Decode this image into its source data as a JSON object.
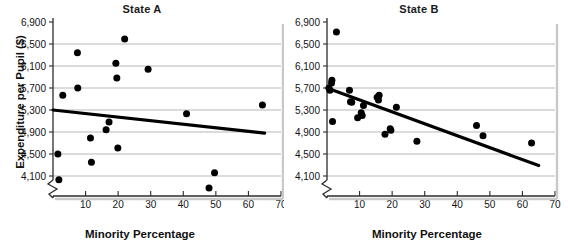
{
  "figure": {
    "axis_label_x": "Minority Percentage",
    "axis_label_y": "Expenditure per Pupil ($)"
  },
  "chart_data": [
    {
      "type": "scatter",
      "title": "State A",
      "xlabel": "Minority Percentage",
      "ylabel": "Expenditure per Pupil ($)",
      "xlim": [
        0,
        70
      ],
      "ylim": [
        3900,
        6900
      ],
      "xticks": [
        10,
        20,
        30,
        40,
        50,
        60,
        70
      ],
      "xtick_labels": [
        "10",
        "20",
        "30",
        "40",
        "50",
        "60",
        "70"
      ],
      "yticks": [
        4100,
        4500,
        4900,
        5300,
        5700,
        6100,
        6500,
        6900
      ],
      "ytick_labels": [
        "4,100",
        "4,500",
        "4,900",
        "5,300",
        "5,700",
        "6,100",
        "6,500",
        "6,900"
      ],
      "grid": true,
      "y_axis_break": true,
      "points": [
        {
          "x": 1.5,
          "y": 4500
        },
        {
          "x": 1.8,
          "y": 4030
        },
        {
          "x": 3.0,
          "y": 5570
        },
        {
          "x": 7.5,
          "y": 6340
        },
        {
          "x": 7.6,
          "y": 5700
        },
        {
          "x": 11.5,
          "y": 4790
        },
        {
          "x": 11.8,
          "y": 4350
        },
        {
          "x": 16.3,
          "y": 4940
        },
        {
          "x": 17.2,
          "y": 5080
        },
        {
          "x": 19.3,
          "y": 6150
        },
        {
          "x": 19.6,
          "y": 5880
        },
        {
          "x": 19.9,
          "y": 4610
        },
        {
          "x": 22.0,
          "y": 6590
        },
        {
          "x": 29.2,
          "y": 6040
        },
        {
          "x": 41.0,
          "y": 5230
        },
        {
          "x": 47.9,
          "y": 3880
        },
        {
          "x": 49.6,
          "y": 4160
        },
        {
          "x": 64.3,
          "y": 5390
        }
      ],
      "trendline": {
        "x0": 0,
        "y0": 5300,
        "x1": 65,
        "y1": 4880,
        "label": "regression-line"
      }
    },
    {
      "type": "scatter",
      "title": "State B",
      "xlabel": "Minority Percentage",
      "ylabel": "Expenditure per Pupil ($)",
      "xlim": [
        0,
        70
      ],
      "ylim": [
        3900,
        6900
      ],
      "xticks": [
        10,
        20,
        30,
        40,
        50,
        60,
        70
      ],
      "xtick_labels": [
        "10",
        "20",
        "30",
        "40",
        "50",
        "60",
        "70"
      ],
      "yticks": [
        4100,
        4500,
        4900,
        5300,
        5700,
        6100,
        6500,
        6900
      ],
      "ytick_labels": [
        "4,100",
        "4,500",
        "4,900",
        "5,300",
        "5,700",
        "6,100",
        "6,500",
        "6,900"
      ],
      "grid": true,
      "y_axis_break": true,
      "points": [
        {
          "x": 0.6,
          "y": 5700
        },
        {
          "x": 0.9,
          "y": 5660
        },
        {
          "x": 1.4,
          "y": 5790
        },
        {
          "x": 1.5,
          "y": 5840
        },
        {
          "x": 1.7,
          "y": 5090
        },
        {
          "x": 2.9,
          "y": 6720
        },
        {
          "x": 6.9,
          "y": 5660
        },
        {
          "x": 7.2,
          "y": 5450
        },
        {
          "x": 7.6,
          "y": 5440
        },
        {
          "x": 9.4,
          "y": 5160
        },
        {
          "x": 10.5,
          "y": 5250
        },
        {
          "x": 10.8,
          "y": 5200
        },
        {
          "x": 11.2,
          "y": 5380
        },
        {
          "x": 15.4,
          "y": 5530
        },
        {
          "x": 15.8,
          "y": 5480
        },
        {
          "x": 16.0,
          "y": 5570
        },
        {
          "x": 17.8,
          "y": 4860
        },
        {
          "x": 19.4,
          "y": 4960
        },
        {
          "x": 19.6,
          "y": 4930
        },
        {
          "x": 21.3,
          "y": 5350
        },
        {
          "x": 27.6,
          "y": 4730
        },
        {
          "x": 45.9,
          "y": 5020
        },
        {
          "x": 47.9,
          "y": 4830
        },
        {
          "x": 62.8,
          "y": 4700
        }
      ],
      "trendline": {
        "x0": 0,
        "y0": 5700,
        "x1": 65,
        "y1": 4290,
        "label": "regression-line"
      }
    }
  ]
}
